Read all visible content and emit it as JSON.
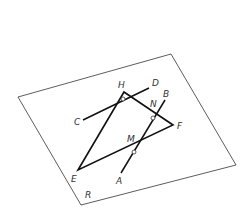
{
  "diagram": {
    "type": "geometry",
    "colors": {
      "plane": "#333333",
      "lines": "#111111",
      "labels": "#333333",
      "background": "#ffffff"
    },
    "plane": {
      "label": "R",
      "label_pos": [
        85,
        198
      ],
      "corners": [
        [
          18,
          97
        ],
        [
          171,
          54
        ],
        [
          236,
          165
        ],
        [
          81,
          205
        ]
      ]
    },
    "triangle": {
      "vertices": {
        "H": {
          "label": "H",
          "pt": [
            124,
            92
          ],
          "label_pos": [
            118,
            88
          ]
        },
        "F": {
          "label": "F",
          "pt": [
            173,
            125
          ],
          "label_pos": [
            177,
            129
          ]
        },
        "E": {
          "label": "E",
          "pt": [
            78,
            170
          ],
          "label_pos": [
            71,
            182
          ]
        }
      }
    },
    "segments": {
      "CD": {
        "from": "C",
        "to": "D",
        "C": {
          "label": "C",
          "pt": [
            83,
            120
          ],
          "label_pos": [
            74,
            125
          ]
        },
        "D": {
          "label": "D",
          "pt": [
            149,
            88
          ],
          "label_pos": [
            152,
            86
          ]
        }
      },
      "AB": {
        "from": "A",
        "to": "B",
        "A": {
          "label": "A",
          "pt": [
            121,
            173
          ],
          "label_pos": [
            116,
            184
          ]
        },
        "B": {
          "label": "B",
          "pt": [
            165,
            100
          ],
          "label_pos": [
            163,
            97
          ]
        }
      }
    },
    "points": {
      "M": {
        "label": "M",
        "label_pos": [
          127,
          142
        ]
      },
      "N": {
        "label": "N",
        "label_pos": [
          150,
          107
        ]
      }
    },
    "markers": [
      {
        "name": "marker-on-HE",
        "pt": [
          123,
          99
        ]
      },
      {
        "name": "marker-N",
        "pt": [
          153,
          118
        ]
      },
      {
        "name": "marker-on-AB",
        "pt": [
          134,
          152
        ]
      }
    ]
  }
}
